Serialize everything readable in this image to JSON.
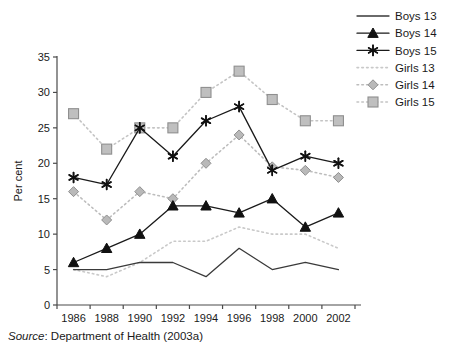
{
  "figure": {
    "clipped_title": "",
    "source_prefix": "Source",
    "source_text": ": Department of Health (2003a)"
  },
  "chart_data": {
    "type": "line",
    "title": "",
    "xlabel": "",
    "ylabel": "Per cent",
    "categories": [
      "1986",
      "1988",
      "1990",
      "1992",
      "1994",
      "1996",
      "1998",
      "2000",
      "2002"
    ],
    "x_tick_labels": [
      "1986",
      "1988",
      "1990",
      "1992",
      "1994",
      "1996",
      "1998",
      "2000",
      "2002"
    ],
    "y_tick_labels": [
      "0",
      "5",
      "10",
      "15",
      "20",
      "25",
      "30",
      "35"
    ],
    "y_ticks": [
      0,
      5,
      10,
      15,
      20,
      25,
      30,
      35
    ],
    "ylim": [
      0,
      35
    ],
    "grid": false,
    "legend_position": "top-right",
    "series": [
      {
        "name": "Boys 13",
        "values": [
          5,
          5,
          6,
          6,
          4,
          8,
          5,
          6,
          5
        ],
        "color": "#3a3a3a",
        "line_style": "solid",
        "marker": "none"
      },
      {
        "name": "Boys 14",
        "values": [
          6,
          8,
          10,
          14,
          14,
          13,
          15,
          11,
          13
        ],
        "color": "#1a1a1a",
        "line_style": "solid",
        "marker": "triangle"
      },
      {
        "name": "Boys 15",
        "values": [
          18,
          17,
          25,
          21,
          26,
          28,
          19,
          21,
          20
        ],
        "color": "#1a1a1a",
        "line_style": "solid",
        "marker": "star"
      },
      {
        "name": "Girls 13",
        "values": [
          5,
          4,
          6,
          9,
          9,
          11,
          10,
          10,
          8
        ],
        "color": "#c9c9c9",
        "line_style": "dotted",
        "marker": "none"
      },
      {
        "name": "Girls 14",
        "values": [
          16,
          12,
          16,
          15,
          20,
          24,
          19.5,
          19,
          18
        ],
        "color": "#bdbdbd",
        "line_style": "dotted",
        "marker": "diamond"
      },
      {
        "name": "Girls 15",
        "values": [
          27,
          22,
          25,
          25,
          30,
          33,
          29,
          26,
          26
        ],
        "color": "#c4c4c4",
        "line_style": "dotted",
        "marker": "square"
      }
    ]
  }
}
